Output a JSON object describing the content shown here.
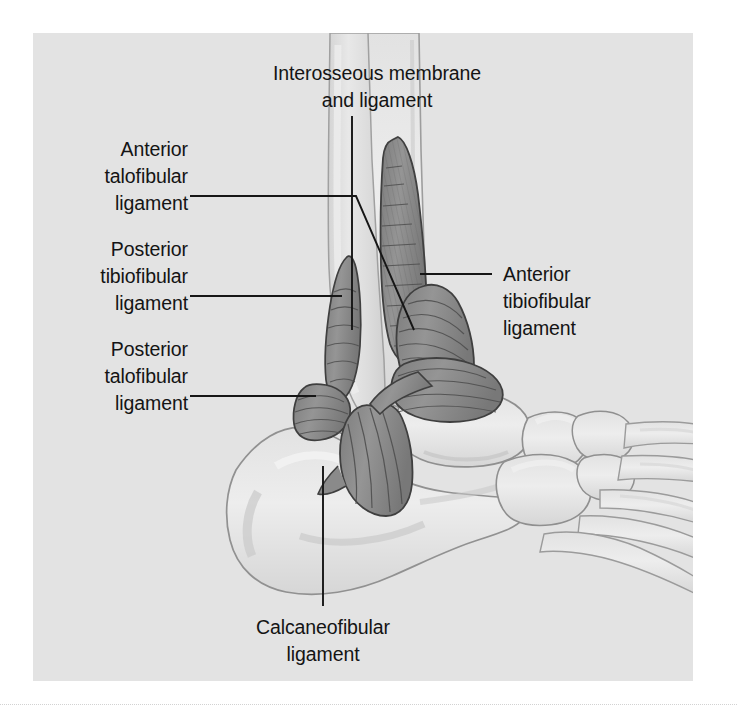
{
  "figure": {
    "kind": "anatomical-illustration",
    "view": "lateral (outside) view of right ankle and foot",
    "panel_background_color": "#e3e3e3",
    "page_background_color": "#ffffff",
    "bone_fill_color": "#dcdcdc",
    "bone_outline_color": "#9a9a9a",
    "ligament_fill_color": "#8e8e8e",
    "ligament_outline_color": "#4a4a4a",
    "ligament_hatch_color": "#5e5e5e",
    "leader_line_color": "#161616",
    "label_text_color": "#141414"
  },
  "labels": {
    "interosseous": {
      "line1": "Interosseous membrane",
      "line2": "and ligament"
    },
    "anterior_talofibular": {
      "line1": "Anterior",
      "line2": "talofibular",
      "line3": "ligament"
    },
    "posterior_tibiofibular": {
      "line1": "Posterior",
      "line2": "tibiofibular",
      "line3": "ligament"
    },
    "posterior_talofibular": {
      "line1": "Posterior",
      "line2": "talofibular",
      "line3": "ligament"
    },
    "anterior_tibiofibular": {
      "line1": "Anterior",
      "line2": "tibiofibular",
      "line3": "ligament"
    },
    "calcaneofibular": {
      "line1": "Calcaneofibular",
      "line2": "ligament"
    }
  },
  "structures": {
    "tibia": "tibia",
    "fibula": "fibula",
    "talus": "talus",
    "calcaneus": "calcaneus",
    "navicular": "navicular",
    "cuboid": "cuboid",
    "cuneiforms": "cuneiforms",
    "metatarsals": "metatarsals"
  }
}
